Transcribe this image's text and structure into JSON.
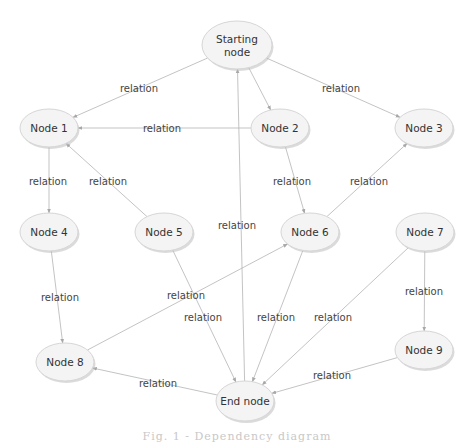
{
  "diagram": {
    "type": "directed-graph",
    "caption": "Fig. 1 - Dependency diagram",
    "nodes": [
      {
        "id": "start",
        "label": [
          "Starting",
          "node"
        ]
      },
      {
        "id": "n1",
        "label": [
          "Node 1"
        ]
      },
      {
        "id": "n2",
        "label": [
          "Node 2"
        ]
      },
      {
        "id": "n3",
        "label": [
          "Node 3"
        ]
      },
      {
        "id": "n4",
        "label": [
          "Node 4"
        ]
      },
      {
        "id": "n5",
        "label": [
          "Node 5"
        ]
      },
      {
        "id": "n6",
        "label": [
          "Node 6"
        ]
      },
      {
        "id": "n7",
        "label": [
          "Node 7"
        ]
      },
      {
        "id": "n8",
        "label": [
          "Node 8"
        ]
      },
      {
        "id": "n9",
        "label": [
          "Node 9"
        ]
      },
      {
        "id": "end",
        "label": [
          "End node"
        ]
      }
    ],
    "edges": [
      {
        "from": "start",
        "to": "n1",
        "label": "relation"
      },
      {
        "from": "start",
        "to": "n2",
        "label": ""
      },
      {
        "from": "start",
        "to": "n3",
        "label": "relation"
      },
      {
        "from": "n2",
        "to": "n1",
        "label": "relation"
      },
      {
        "from": "n1",
        "to": "n4",
        "label": "relation"
      },
      {
        "from": "n5",
        "to": "n1",
        "label": "relation"
      },
      {
        "from": "n2",
        "to": "n6",
        "label": "relation"
      },
      {
        "from": "n6",
        "to": "n3",
        "label": "relation"
      },
      {
        "from": "n4",
        "to": "n8",
        "label": "relation"
      },
      {
        "from": "n8",
        "to": "n6",
        "label": "relation"
      },
      {
        "from": "n5",
        "to": "end",
        "label": "relation"
      },
      {
        "from": "end",
        "to": "start",
        "label": "relation"
      },
      {
        "from": "n6",
        "to": "end",
        "label": "relation"
      },
      {
        "from": "n7",
        "to": "end",
        "label": "relation"
      },
      {
        "from": "n7",
        "to": "n9",
        "label": "relation"
      },
      {
        "from": "n9",
        "to": "end",
        "label": "relation"
      },
      {
        "from": "end",
        "to": "n8",
        "label": "relation"
      }
    ]
  }
}
